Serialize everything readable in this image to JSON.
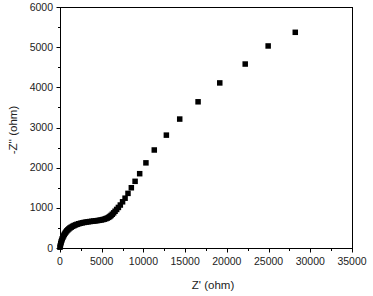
{
  "chart_data": {
    "type": "scatter",
    "title": "",
    "xlabel": "Z' (ohm)",
    "ylabel": "-Z'' (ohm)",
    "xlim": [
      0,
      35000
    ],
    "ylim": [
      0,
      6000
    ],
    "x_ticks": [
      0,
      5000,
      10000,
      15000,
      20000,
      25000,
      30000,
      35000
    ],
    "y_ticks": [
      0,
      1000,
      2000,
      3000,
      4000,
      5000,
      6000
    ],
    "x_minor_step": 2500,
    "y_minor_step": 500,
    "grid": false,
    "legend": null,
    "marker": "square",
    "marker_color": "#000000",
    "series": [
      {
        "name": "Nyquist",
        "points": [
          [
            0,
            20
          ],
          [
            40,
            60
          ],
          [
            90,
            110
          ],
          [
            140,
            150
          ],
          [
            200,
            190
          ],
          [
            270,
            230
          ],
          [
            340,
            265
          ],
          [
            420,
            300
          ],
          [
            510,
            335
          ],
          [
            600,
            365
          ],
          [
            700,
            395
          ],
          [
            810,
            425
          ],
          [
            930,
            450
          ],
          [
            1060,
            475
          ],
          [
            1200,
            500
          ],
          [
            1350,
            520
          ],
          [
            1510,
            540
          ],
          [
            1680,
            558
          ],
          [
            1860,
            575
          ],
          [
            2050,
            590
          ],
          [
            2250,
            604
          ],
          [
            2460,
            616
          ],
          [
            2680,
            627
          ],
          [
            2900,
            637
          ],
          [
            3130,
            645
          ],
          [
            3360,
            652
          ],
          [
            3590,
            659
          ],
          [
            3820,
            665
          ],
          [
            4050,
            671
          ],
          [
            4280,
            677
          ],
          [
            4500,
            683
          ],
          [
            4720,
            690
          ],
          [
            4930,
            698
          ],
          [
            5130,
            707
          ],
          [
            5320,
            718
          ],
          [
            5500,
            731
          ],
          [
            5670,
            746
          ],
          [
            5830,
            764
          ],
          [
            5980,
            785
          ],
          [
            6120,
            810
          ],
          [
            6270,
            840
          ],
          [
            6430,
            875
          ],
          [
            6600,
            915
          ],
          [
            6790,
            960
          ],
          [
            7000,
            1010
          ],
          [
            7230,
            1070
          ],
          [
            7500,
            1150
          ],
          [
            7800,
            1240
          ],
          [
            8150,
            1360
          ],
          [
            8550,
            1500
          ],
          [
            9000,
            1660
          ],
          [
            9550,
            1850
          ],
          [
            10300,
            2120
          ],
          [
            11300,
            2440
          ],
          [
            12750,
            2810
          ],
          [
            14350,
            3210
          ],
          [
            16550,
            3640
          ],
          [
            19150,
            4110
          ],
          [
            22200,
            4580
          ],
          [
            24950,
            5030
          ],
          [
            28200,
            5370
          ]
        ]
      }
    ],
    "plot_area_px": {
      "left": 60,
      "right": 352,
      "top": 7,
      "bottom": 248
    }
  }
}
